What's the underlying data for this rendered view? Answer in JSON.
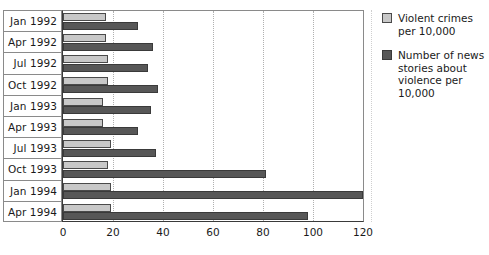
{
  "chart_data": {
    "type": "bar",
    "orientation": "horizontal",
    "title": "",
    "xlabel": "",
    "ylabel": "",
    "xlim": [
      0,
      120
    ],
    "xticks": [
      0,
      20,
      40,
      60,
      80,
      100,
      120
    ],
    "grid": true,
    "legend_position": "right",
    "categories": [
      "Jan 1992",
      "Apr 1992",
      "Jul 1992",
      "Oct 1992",
      "Jan 1993",
      "Apr 1993",
      "Jul 1993",
      "Oct 1993",
      "Jan 1994",
      "Apr 1994"
    ],
    "series": [
      {
        "name": "Violent crimes per 10,000",
        "color": "#c8c8c8",
        "values": [
          17,
          17,
          18,
          18,
          16,
          16,
          19,
          18,
          19,
          19
        ]
      },
      {
        "name": "Number of news stories about violence per 10,000",
        "color": "#575757",
        "values": [
          30,
          36,
          34,
          38,
          35,
          30,
          37,
          81,
          120,
          98
        ]
      }
    ]
  },
  "legend": {
    "items": [
      {
        "swatch": "light",
        "label": "Violent crimes per 10,000"
      },
      {
        "swatch": "dark",
        "label": "Number of news stories about violence per 10,000"
      }
    ]
  }
}
